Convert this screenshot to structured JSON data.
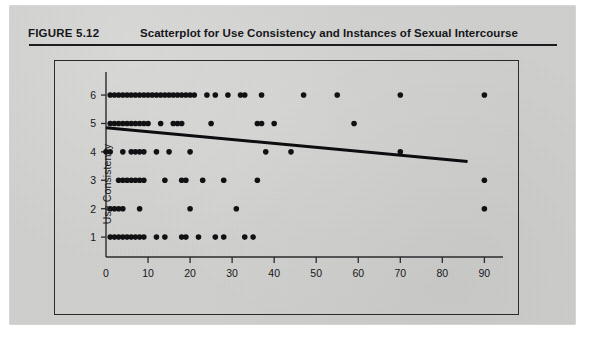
{
  "figure": {
    "label": "FIGURE 5.12",
    "title": "Scatterplot for Use Consistency and Instances of Sexual Intercourse"
  },
  "colors": {
    "page_background": "#cfcfcd",
    "ink": "#17171a",
    "axis": "#2b2b2e",
    "point": "#111113",
    "regression_line": "#0d0d0f"
  },
  "chart_data": {
    "type": "scatter",
    "title": "Scatterplot for Use Consistency and Instances of Sexual Intercourse",
    "xlabel": "Instances of Sexual Intercourse",
    "ylabel": "Use Consistency",
    "xlim": [
      0,
      93
    ],
    "ylim": [
      0.3,
      6.6
    ],
    "xticks": [
      0,
      10,
      20,
      30,
      40,
      50,
      60,
      70,
      80,
      90
    ],
    "xticklabels": [
      "0",
      "10",
      "20",
      "30",
      "40",
      "50",
      "60",
      "70",
      "80",
      "90"
    ],
    "yticks": [
      1,
      2,
      3,
      4,
      5,
      6
    ],
    "yticklabels": [
      "1",
      "2",
      "3",
      "4",
      "5",
      "6"
    ],
    "grid": false,
    "legend": null,
    "marker": "filled-circle",
    "marker_size": 4.0,
    "points": [
      [
        1,
        6
      ],
      [
        2,
        6
      ],
      [
        3,
        6
      ],
      [
        4,
        6
      ],
      [
        5,
        6
      ],
      [
        6,
        6
      ],
      [
        7,
        6
      ],
      [
        8,
        6
      ],
      [
        9,
        6
      ],
      [
        10,
        6
      ],
      [
        11,
        6
      ],
      [
        12,
        6
      ],
      [
        13,
        6
      ],
      [
        14,
        6
      ],
      [
        15,
        6
      ],
      [
        16,
        6
      ],
      [
        17,
        6
      ],
      [
        18,
        6
      ],
      [
        19,
        6
      ],
      [
        20,
        6
      ],
      [
        21,
        6
      ],
      [
        24,
        6
      ],
      [
        26,
        6
      ],
      [
        29,
        6
      ],
      [
        32,
        6
      ],
      [
        33,
        6
      ],
      [
        37,
        6
      ],
      [
        47,
        6
      ],
      [
        55,
        6
      ],
      [
        70,
        6
      ],
      [
        90,
        6
      ],
      [
        1,
        5
      ],
      [
        2,
        5
      ],
      [
        3,
        5
      ],
      [
        4,
        5
      ],
      [
        5,
        5
      ],
      [
        6,
        5
      ],
      [
        7,
        5
      ],
      [
        8,
        5
      ],
      [
        9,
        5
      ],
      [
        10,
        5
      ],
      [
        13,
        5
      ],
      [
        16,
        5
      ],
      [
        17,
        5
      ],
      [
        18,
        5
      ],
      [
        25,
        5
      ],
      [
        36,
        5
      ],
      [
        37,
        5
      ],
      [
        40,
        5
      ],
      [
        59,
        5
      ],
      [
        0,
        4
      ],
      [
        1,
        4
      ],
      [
        4,
        4
      ],
      [
        6,
        4
      ],
      [
        7,
        4
      ],
      [
        8,
        4
      ],
      [
        9,
        4
      ],
      [
        12,
        4
      ],
      [
        15,
        4
      ],
      [
        20,
        4
      ],
      [
        38,
        4
      ],
      [
        44,
        4
      ],
      [
        70,
        4
      ],
      [
        3,
        3
      ],
      [
        4,
        3
      ],
      [
        5,
        3
      ],
      [
        6,
        3
      ],
      [
        7,
        3
      ],
      [
        8,
        3
      ],
      [
        9,
        3
      ],
      [
        14,
        3
      ],
      [
        18,
        3
      ],
      [
        19,
        3
      ],
      [
        23,
        3
      ],
      [
        28,
        3
      ],
      [
        36,
        3
      ],
      [
        90,
        3
      ],
      [
        1,
        2
      ],
      [
        2,
        2
      ],
      [
        3,
        2
      ],
      [
        4,
        2
      ],
      [
        8,
        2
      ],
      [
        20,
        2
      ],
      [
        31,
        2
      ],
      [
        90,
        2
      ],
      [
        1,
        1
      ],
      [
        2,
        1
      ],
      [
        3,
        1
      ],
      [
        4,
        1
      ],
      [
        5,
        1
      ],
      [
        6,
        1
      ],
      [
        7,
        1
      ],
      [
        8,
        1
      ],
      [
        9,
        1
      ],
      [
        12,
        1
      ],
      [
        14,
        1
      ],
      [
        18,
        1
      ],
      [
        19,
        1
      ],
      [
        22,
        1
      ],
      [
        26,
        1
      ],
      [
        28,
        1
      ],
      [
        33,
        1
      ],
      [
        35,
        1
      ]
    ],
    "regression_line": {
      "x_start": 0,
      "y_start": 4.85,
      "x_end": 86,
      "y_end": 3.66,
      "line_width": 3
    }
  }
}
